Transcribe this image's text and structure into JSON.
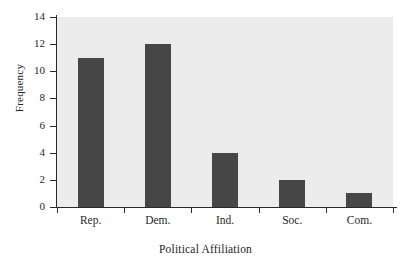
{
  "chart_data": {
    "type": "bar",
    "title": "",
    "subtitle": "",
    "xlabel": "Political Affiliation",
    "ylabel": "Frequency",
    "categories": [
      "Rep.",
      "Dem.",
      "Ind.",
      "Soc.",
      "Com."
    ],
    "values": [
      11,
      12,
      4,
      2,
      1
    ],
    "series": [
      {
        "name": "Frequency",
        "values": [
          11,
          12,
          4,
          2,
          1
        ]
      }
    ],
    "ylim": [
      0,
      14
    ],
    "ytick_values": [
      0,
      2,
      4,
      6,
      8,
      10,
      12,
      14
    ],
    "ytick_labels": [
      "0",
      "2",
      "4",
      "6",
      "8",
      "10",
      "12",
      "14"
    ],
    "grid": false,
    "legend": false,
    "legend_position": "none",
    "annotations": [],
    "colors": {
      "bar_fill": "#464646",
      "plot_background": "#ececec",
      "figure_background": "#ffffff",
      "axis_line": "#2a2a2a",
      "text": "#1f1f1f"
    }
  }
}
